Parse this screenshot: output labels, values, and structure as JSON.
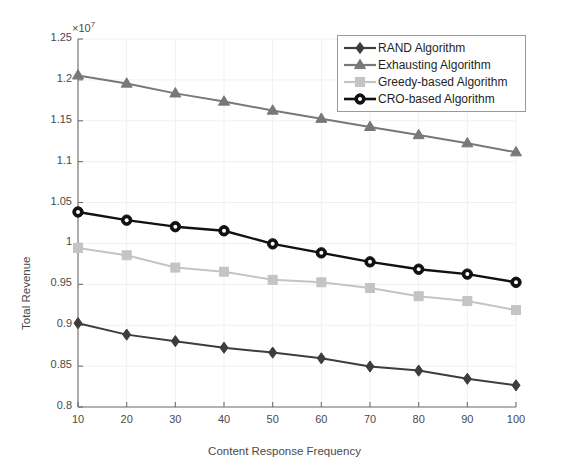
{
  "chart_data": {
    "type": "line",
    "title": "",
    "xlabel": "Content Response Frequency",
    "ylabel": "Total Revenue",
    "y_exponent_label": "×10",
    "y_exponent_value": "7",
    "y_scale": 10000000,
    "x": [
      10,
      20,
      30,
      40,
      50,
      60,
      70,
      80,
      90,
      100
    ],
    "xlim": [
      10,
      100
    ],
    "ylim": [
      0.8,
      1.25
    ],
    "xticks": [
      10,
      20,
      30,
      40,
      50,
      60,
      70,
      80,
      90,
      100
    ],
    "yticks": [
      0.8,
      0.85,
      0.9,
      0.95,
      1,
      1.05,
      1.1,
      1.15,
      1.2,
      1.25
    ],
    "ytick_labels": [
      "0.8",
      "0.85",
      "0.9",
      "0.95",
      "1",
      "1.05",
      "1.1",
      "1.15",
      "1.2",
      "1.25"
    ],
    "xtick_labels": [
      "10",
      "20",
      "30",
      "40",
      "50",
      "60",
      "70",
      "80",
      "90",
      "100"
    ],
    "grid": true,
    "legend_position": "top-right",
    "series": [
      {
        "name": "RAND Algorithm",
        "marker": "diamond",
        "color": "#3d3d3d",
        "values": [
          0.9025,
          0.8885,
          0.8805,
          0.8725,
          0.8665,
          0.8595,
          0.8495,
          0.8445,
          0.8345,
          0.8265
        ]
      },
      {
        "name": "Exhausting Algorithm",
        "marker": "triangle",
        "color": "#787878",
        "values": [
          1.2055,
          1.1955,
          1.1835,
          1.1735,
          1.1625,
          1.1525,
          1.1425,
          1.1325,
          1.1225,
          1.1115
        ]
      },
      {
        "name": "Greedy-based Algorithm",
        "marker": "square",
        "color": "#c4c4c4",
        "values": [
          0.9945,
          0.9855,
          0.9705,
          0.9655,
          0.9555,
          0.9525,
          0.9455,
          0.9355,
          0.9295,
          0.9185
        ]
      },
      {
        "name": "CRO-based Algorithm",
        "marker": "circle",
        "color": "#111111",
        "values": [
          1.0385,
          1.0285,
          1.0205,
          1.0155,
          0.9995,
          0.9885,
          0.9775,
          0.9685,
          0.9625,
          0.9525
        ]
      }
    ]
  },
  "legend": {
    "items": [
      {
        "label": "RAND Algorithm"
      },
      {
        "label": "Exhausting Algorithm"
      },
      {
        "label": "Greedy-based Algorithm"
      },
      {
        "label": "CRO-based Algorithm"
      }
    ]
  },
  "colors": {
    "background": "#ffffff",
    "axis": "#6e6e6e",
    "grid": "#f0f0f0",
    "text": "#4a4a4a"
  }
}
